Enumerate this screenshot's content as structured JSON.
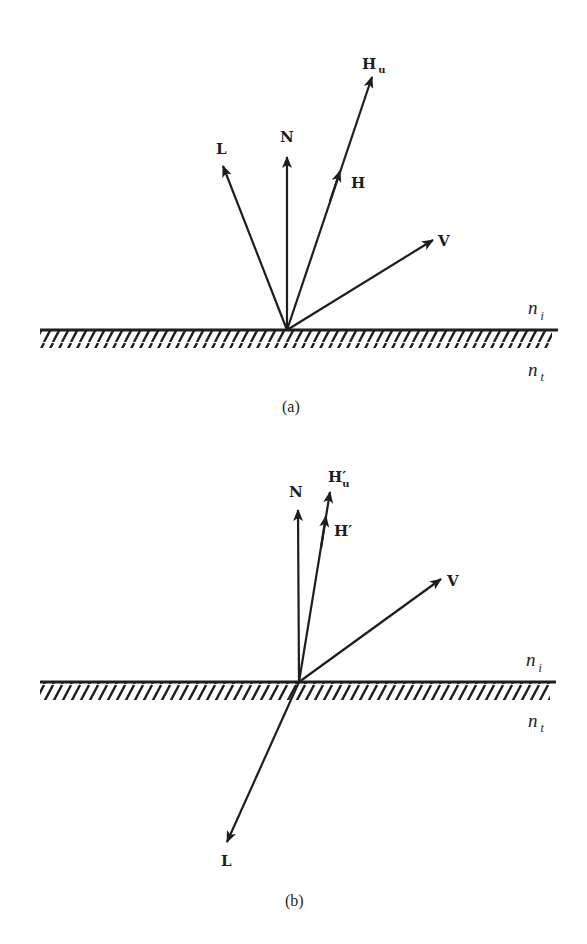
{
  "figure": {
    "panel_a": {
      "caption": "(a)",
      "labels": {
        "L": "L",
        "N": "N",
        "H": "H",
        "Hu_main": "H",
        "Hu_sub": "u",
        "V": "V",
        "n_i_main": "n",
        "n_i_sub": "i",
        "n_t_main": "n",
        "n_t_sub": "t"
      }
    },
    "panel_b": {
      "caption": "(b)",
      "labels": {
        "L": "L",
        "N": "N",
        "Hp": "H′",
        "Hpu_main": "H′",
        "Hpu_sub": "u",
        "V": "V",
        "n_i_main": "n",
        "n_i_sub": "i",
        "n_t_main": "n",
        "n_t_sub": "t"
      }
    },
    "colors": {
      "ink": "#1e1e1e",
      "background": "#ffffff"
    }
  }
}
